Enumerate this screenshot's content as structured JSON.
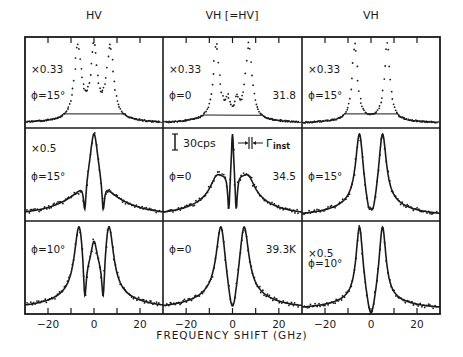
{
  "chart_data": {
    "type": "line",
    "title": "",
    "xlabel": "FREQUENCY SHIFT (GHz)",
    "ylabel": "",
    "xlim": [
      -30,
      30
    ],
    "xticks": [
      -20,
      0,
      20
    ],
    "minor_ticks": [
      -20,
      -10,
      0,
      10,
      20
    ],
    "grid": false,
    "columns": [
      "HV",
      "VH [=HV]",
      "VH"
    ],
    "scale_bar": {
      "label": "30cps"
    },
    "resolution_marker": {
      "label": "Γinst"
    },
    "rows": [
      {
        "temperature": "31.8",
        "panels": [
          {
            "column": "HV",
            "scale": "×0.33",
            "phi": "ϕ=15°",
            "peaks_GHz": [
              -7,
              0,
              7
            ],
            "style": "points"
          },
          {
            "column": "VH [=HV]",
            "scale": "×0.33",
            "phi": "ϕ=0",
            "peaks_GHz": [
              -7,
              7
            ],
            "minor_peaks_GHz": [
              -2,
              2
            ],
            "style": "points"
          },
          {
            "column": "VH",
            "scale": "×0.33",
            "phi": "ϕ=15°",
            "peaks_GHz": [
              -7,
              7
            ],
            "style": "points"
          }
        ]
      },
      {
        "temperature": "34.5",
        "panels": [
          {
            "column": "HV",
            "scale": "×0.5",
            "phi": "ϕ=15°",
            "peaks_GHz": [
              0
            ],
            "shoulders_GHz": [
              -7,
              7
            ],
            "dips_GHz": [
              -4,
              4
            ],
            "style": "points+fit"
          },
          {
            "column": "VH [=HV]",
            "scale": "",
            "phi": "ϕ=0",
            "peaks_GHz": [
              -7,
              0,
              7
            ],
            "dips_GHz": [
              -1.5,
              1.5
            ],
            "style": "points+fit"
          },
          {
            "column": "VH",
            "scale": "",
            "phi": "ϕ=15°",
            "peaks_GHz": [
              -5,
              5
            ],
            "center_bump_GHz": 0,
            "style": "points+fit"
          }
        ]
      },
      {
        "temperature": "39.3K",
        "panels": [
          {
            "column": "HV",
            "scale": "",
            "phi": "ϕ=10°",
            "peaks_GHz": [
              -6,
              0,
              6
            ],
            "dips_GHz": [
              -4,
              4
            ],
            "style": "points+fit"
          },
          {
            "column": "VH [=HV]",
            "scale": "",
            "phi": "ϕ=0",
            "peaks_GHz": [
              -5,
              5
            ],
            "style": "points+fit"
          },
          {
            "column": "VH",
            "scale": "×0.5",
            "phi": "ϕ=10°",
            "peaks_GHz": [
              -5,
              5
            ],
            "style": "points+fit"
          }
        ]
      }
    ]
  },
  "labels": {
    "col1": "HV",
    "col2": "VH [=HV]",
    "col3": "VH",
    "xlabel": "FREQUENCY SHIFT (GHz)",
    "scale_bar": "30cps",
    "gamma": "Γ",
    "gamma_sub": "inst"
  }
}
